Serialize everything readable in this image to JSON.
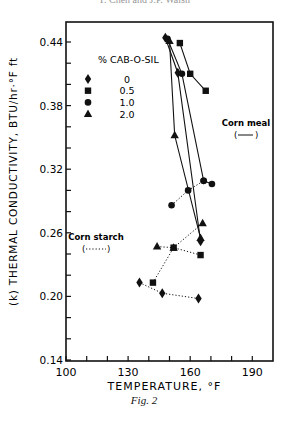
{
  "header": {
    "running_title": "Y. Chen and J.P. Walsh"
  },
  "caption": "Fig. 2",
  "chart_data": {
    "type": "scatter",
    "title": "",
    "xlabel": "TEMPERATURE, °F",
    "ylabel": "(k) THERMAL CONDUCTIVITY, BTU/hr·°F ft",
    "xlim": [
      100,
      200
    ],
    "ylim": [
      0.14,
      0.46
    ],
    "x_ticks": [
      100,
      130,
      160,
      190
    ],
    "x_minor_step": 10,
    "y_ticks": [
      0.14,
      0.2,
      0.26,
      0.32,
      0.38,
      0.44
    ],
    "y_minor_step": 0.02,
    "grid": false,
    "legend": {
      "title": "% CAB-O-SIL",
      "position": "upper-left",
      "entries": [
        {
          "marker": "diamond",
          "label": "0"
        },
        {
          "marker": "square",
          "label": "0.5"
        },
        {
          "marker": "circle",
          "label": "1.0"
        },
        {
          "marker": "triangle",
          "label": "2.0"
        }
      ]
    },
    "annotations": [
      {
        "text": "Corn meal",
        "line_style": "solid",
        "x": 185,
        "y": 0.355
      },
      {
        "text": "Corn starch",
        "line_style": "dotted",
        "x": 120,
        "y": 0.262
      }
    ],
    "series": [
      {
        "name": "Corn meal 0%",
        "product": "Corn meal",
        "marker": "diamond",
        "line": "solid",
        "x": [
          148,
          154,
          165
        ],
        "y": [
          0.444,
          0.411,
          0.252
        ]
      },
      {
        "name": "Corn meal 0.5%",
        "product": "Corn meal",
        "marker": "square",
        "line": "solid",
        "x": [
          155,
          160,
          167.5
        ],
        "y": [
          0.439,
          0.41,
          0.394
        ]
      },
      {
        "name": "Corn meal 1.0%",
        "product": "Corn meal",
        "marker": "circle",
        "line": "solid",
        "x": [
          149,
          156,
          166.5,
          170.5
        ],
        "y": [
          0.443,
          0.41,
          0.309,
          0.306
        ]
      },
      {
        "name": "Corn meal 2.0%",
        "product": "Corn meal",
        "marker": "triangle",
        "line": "solid",
        "x": [
          150,
          152.5,
          165
        ],
        "y": [
          0.441,
          0.352,
          0.255
        ]
      },
      {
        "name": "Corn starch 0%",
        "product": "Corn starch",
        "marker": "diamond",
        "line": "dotted",
        "x": [
          135.5,
          146.5,
          164
        ],
        "y": [
          0.213,
          0.203,
          0.198
        ]
      },
      {
        "name": "Corn starch 0.5%",
        "product": "Corn starch",
        "marker": "square",
        "line": "dotted",
        "x": [
          142,
          152,
          165
        ],
        "y": [
          0.213,
          0.246,
          0.239
        ]
      },
      {
        "name": "Corn starch 1.0%",
        "product": "Corn starch",
        "marker": "circle",
        "line": "dotted",
        "x": [
          151,
          159,
          166.5
        ],
        "y": [
          0.286,
          0.3,
          0.309
        ]
      },
      {
        "name": "Corn starch 2.0%",
        "product": "Corn starch",
        "marker": "triangle",
        "line": "dotted",
        "x": [
          144,
          152,
          166
        ],
        "y": [
          0.247,
          0.246,
          0.269
        ]
      }
    ]
  }
}
